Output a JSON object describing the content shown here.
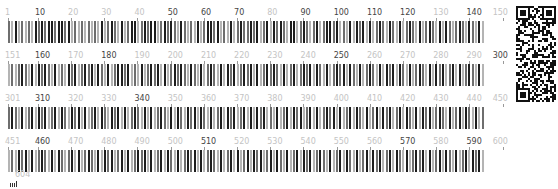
{
  "figure": {
    "type": "sequence-position-barcode",
    "positions_per_row": 150,
    "total_positions": 604,
    "shade_colors": [
      "#ffffff",
      "#dedede",
      "#b4b4b4",
      "#6e6e6e",
      "#1e1e1e"
    ]
  },
  "rows": [
    {
      "start": 1,
      "end": 150,
      "labels": [
        {
          "text": "1",
          "pos": 1,
          "tone": "light"
        },
        {
          "text": "10",
          "pos": 10,
          "tone": "dark"
        },
        {
          "text": "20",
          "pos": 20,
          "tone": "light"
        },
        {
          "text": "30",
          "pos": 30,
          "tone": "light"
        },
        {
          "text": "40",
          "pos": 40,
          "tone": "light"
        },
        {
          "text": "50",
          "pos": 50,
          "tone": "dark"
        },
        {
          "text": "60",
          "pos": 60,
          "tone": "dark"
        },
        {
          "text": "70",
          "pos": 70,
          "tone": "dark"
        },
        {
          "text": "80",
          "pos": 80,
          "tone": "light"
        },
        {
          "text": "90",
          "pos": 90,
          "tone": "dark"
        },
        {
          "text": "100",
          "pos": 100,
          "tone": "dark"
        },
        {
          "text": "110",
          "pos": 110,
          "tone": "dark"
        },
        {
          "text": "120",
          "pos": 120,
          "tone": "dark"
        },
        {
          "text": "130",
          "pos": 130,
          "tone": "light"
        },
        {
          "text": "140",
          "pos": 140,
          "tone": "dark"
        },
        {
          "text": "150",
          "pos": 150,
          "tone": "light"
        }
      ],
      "shades": "324232324343443443423232323242343242344234344234343243232423443423242343343423424343244234323423443423242434242343243242343242343242432343243242"
    },
    {
      "start": 151,
      "end": 300,
      "labels": [
        {
          "text": "151",
          "pos": 1,
          "tone": "light"
        },
        {
          "text": "160",
          "pos": 10,
          "tone": "dark"
        },
        {
          "text": "170",
          "pos": 20,
          "tone": "light"
        },
        {
          "text": "180",
          "pos": 30,
          "tone": "dark"
        },
        {
          "text": "190",
          "pos": 40,
          "tone": "light"
        },
        {
          "text": "200",
          "pos": 50,
          "tone": "light"
        },
        {
          "text": "210",
          "pos": 60,
          "tone": "light"
        },
        {
          "text": "220",
          "pos": 70,
          "tone": "light"
        },
        {
          "text": "230",
          "pos": 80,
          "tone": "light"
        },
        {
          "text": "240",
          "pos": 90,
          "tone": "light"
        },
        {
          "text": "250",
          "pos": 100,
          "tone": "dark"
        },
        {
          "text": "260",
          "pos": 110,
          "tone": "light"
        },
        {
          "text": "270",
          "pos": 120,
          "tone": "light"
        },
        {
          "text": "280",
          "pos": 130,
          "tone": "light"
        },
        {
          "text": "290",
          "pos": 140,
          "tone": "light"
        },
        {
          "text": "300",
          "pos": 150,
          "tone": "dark"
        }
      ],
      "shades": "232343242434324232434234342432423443423242343424234343243242343242434234342423434324234234342432423434243242343242434243242343242434234242343242"
    },
    {
      "start": 301,
      "end": 450,
      "labels": [
        {
          "text": "301",
          "pos": 1,
          "tone": "light"
        },
        {
          "text": "310",
          "pos": 10,
          "tone": "dark"
        },
        {
          "text": "320",
          "pos": 20,
          "tone": "light"
        },
        {
          "text": "330",
          "pos": 30,
          "tone": "light"
        },
        {
          "text": "340",
          "pos": 40,
          "tone": "dark"
        },
        {
          "text": "350",
          "pos": 50,
          "tone": "light"
        },
        {
          "text": "360",
          "pos": 60,
          "tone": "light"
        },
        {
          "text": "370",
          "pos": 70,
          "tone": "light"
        },
        {
          "text": "380",
          "pos": 80,
          "tone": "light"
        },
        {
          "text": "390",
          "pos": 90,
          "tone": "light"
        },
        {
          "text": "400",
          "pos": 100,
          "tone": "light"
        },
        {
          "text": "410",
          "pos": 110,
          "tone": "light"
        },
        {
          "text": "420",
          "pos": 120,
          "tone": "light"
        },
        {
          "text": "430",
          "pos": 130,
          "tone": "light"
        },
        {
          "text": "440",
          "pos": 140,
          "tone": "light"
        },
        {
          "text": "450",
          "pos": 150,
          "tone": "light"
        }
      ],
      "shades": "343242342434234243243424234243243424234324242343242432434243242342434234242434232423424342342423434242342432423424342342432424342343242342432423"
    },
    {
      "start": 451,
      "end": 600,
      "labels": [
        {
          "text": "451",
          "pos": 1,
          "tone": "light"
        },
        {
          "text": "460",
          "pos": 10,
          "tone": "dark"
        },
        {
          "text": "470",
          "pos": 20,
          "tone": "light"
        },
        {
          "text": "480",
          "pos": 30,
          "tone": "light"
        },
        {
          "text": "490",
          "pos": 40,
          "tone": "light"
        },
        {
          "text": "500",
          "pos": 50,
          "tone": "light"
        },
        {
          "text": "510",
          "pos": 60,
          "tone": "dark"
        },
        {
          "text": "520",
          "pos": 70,
          "tone": "light"
        },
        {
          "text": "530",
          "pos": 80,
          "tone": "light"
        },
        {
          "text": "540",
          "pos": 90,
          "tone": "light"
        },
        {
          "text": "550",
          "pos": 100,
          "tone": "light"
        },
        {
          "text": "560",
          "pos": 110,
          "tone": "light"
        },
        {
          "text": "570",
          "pos": 120,
          "tone": "dark"
        },
        {
          "text": "580",
          "pos": 130,
          "tone": "light"
        },
        {
          "text": "590",
          "pos": 140,
          "tone": "dark"
        },
        {
          "text": "600",
          "pos": 150,
          "tone": "light"
        }
      ],
      "shades": "232434242343242432342423432424342342423434242342432423434242343242342423424342342432423424342343242342432423424342342432423434242342432423424342"
    },
    {
      "start": 601,
      "end": 604,
      "labels": [
        {
          "text": "604",
          "pos": 4,
          "tone": "light"
        }
      ],
      "shades": ""
    }
  ],
  "qr_code": {
    "label": "qr-code"
  },
  "footer_icon": {
    "name": "legend-icon"
  }
}
